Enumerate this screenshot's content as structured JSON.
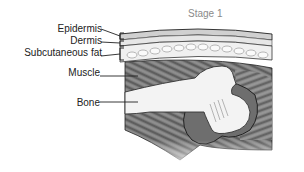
{
  "title": "Stage 1",
  "labels": [
    {
      "id": "epidermis",
      "text": "Epidermis"
    },
    {
      "id": "dermis",
      "text": "Dermis"
    },
    {
      "id": "subcutaneous-fat",
      "text": "Subcutaneous fat"
    },
    {
      "id": "muscle",
      "text": "Muscle"
    },
    {
      "id": "bone",
      "text": "Bone"
    }
  ],
  "colors": {
    "line": "#222222",
    "muscle_dark": "#5a5a5a",
    "muscle_mid": "#8c8c8c",
    "skin": "#d8d8d8",
    "fat": "#eeeeee",
    "bone": "#f4f4f4",
    "title_gray": "#8a8a8a"
  }
}
